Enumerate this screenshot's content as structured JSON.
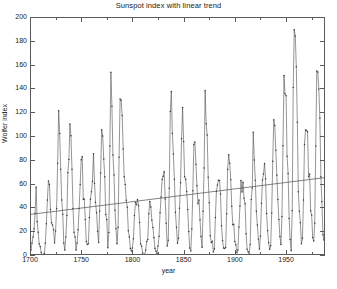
{
  "chart_data": {
    "type": "line",
    "title": "Sunspot index with linear trend",
    "xlabel": "year",
    "ylabel": "Wolfer index",
    "xlim": [
      1700,
      1988
    ],
    "ylim": [
      0,
      200
    ],
    "grid": false,
    "legend": null,
    "markers": "dot",
    "line_color": "#4d4d4d",
    "trend_color": "#4d4d4d",
    "xticks": [
      1700,
      1750,
      1800,
      1850,
      1900,
      1950
    ],
    "xtick_labels": [
      "1700",
      "1750",
      "1800",
      "1850",
      "1900",
      "1950"
    ],
    "xticks_minor": [
      1725,
      1775,
      1825,
      1875,
      1925,
      1975
    ],
    "yticks": [
      0,
      20,
      40,
      60,
      80,
      100,
      120,
      140,
      160,
      180,
      200
    ],
    "ytick_labels": [
      "0",
      "20",
      "40",
      "60",
      "80",
      "100",
      "120",
      "140",
      "160",
      "180",
      "200"
    ],
    "series": [
      {
        "name": "Wolfer sunspot index",
        "x_start": 1700,
        "x_step": 1,
        "values": [
          5,
          11,
          16,
          23,
          36,
          58,
          29,
          20,
          10,
          8,
          3,
          0,
          0,
          2,
          11,
          27,
          47,
          63,
          60,
          39,
          28,
          26,
          22,
          11,
          21,
          40,
          78,
          122,
          103,
          73,
          47,
          35,
          11,
          5,
          16,
          34,
          70,
          81,
          111,
          101,
          73,
          40,
          20,
          16,
          5,
          11,
          22,
          40,
          60,
          80.9,
          83.4,
          47.7,
          47.8,
          30.7,
          12.2,
          9.6,
          10.2,
          32.4,
          47.6,
          54,
          62.9,
          85.9,
          61.2,
          45.1,
          36.4,
          20.9,
          11.4,
          37.8,
          69.8,
          106.1,
          100.8,
          81.6,
          66.5,
          34.8,
          30.6,
          7,
          19.8,
          92.5,
          154.4,
          125.9,
          84.8,
          68.1,
          38.5,
          22.8,
          10.2,
          24.1,
          82.9,
          132,
          130.9,
          118.1,
          89.9,
          66.6,
          60,
          46.9,
          41,
          21.3,
          16,
          6.4,
          4.1,
          6.8,
          14.5,
          34,
          45,
          43.1,
          47.5,
          42.2,
          28.1,
          10.1,
          8.1,
          2.5,
          0,
          1.4,
          5,
          12.2,
          13.9,
          35.4,
          45.8,
          41.1,
          30.1,
          23.9,
          15.6,
          6.6,
          4,
          1.8,
          8.5,
          16.6,
          36.3,
          49.6,
          64.2,
          67,
          70.9,
          47.8,
          27.5,
          8.5,
          13.2,
          56.9,
          121.5,
          138.3,
          103.2,
          85.7,
          64.6,
          36.7,
          24.2,
          10.7,
          15,
          40.1,
          61.5,
          98.5,
          124.7,
          96.3,
          66.6,
          64.5,
          54.1,
          39,
          20.6,
          6.7,
          4.3,
          22.7,
          54.8,
          93.8,
          95.8,
          77.2,
          59.1,
          44,
          47,
          30.5,
          16.3,
          7.3,
          37.6,
          74,
          139,
          111.2,
          101.6,
          66.2,
          44.7,
          17,
          11.3,
          12.4,
          3.4,
          6,
          32.3,
          54.3,
          59.7,
          63.7,
          63.5,
          52.2,
          25.4,
          13.1,
          6.8,
          6.3,
          7.1,
          35.6,
          73,
          85.1,
          78,
          64,
          41.8,
          26.2,
          26.7,
          12.1,
          9.5,
          2.7,
          5,
          24.4,
          42,
          63.5,
          53.8,
          62,
          48.5,
          43.9,
          18.6,
          5.7,
          3.6,
          1.4,
          9.6,
          47.4,
          57.1,
          103.9,
          80.6,
          63.6,
          37.6,
          26.1,
          14.2,
          5.8,
          16.7,
          44.3,
          63.9,
          69,
          77.8,
          64.9,
          35.7,
          21.2,
          11.1,
          5.7,
          8.7,
          36.1,
          79.7,
          114.4,
          109.6,
          88.8,
          67.8,
          47.5,
          30.6,
          16.3,
          9.6,
          33.2,
          92.6,
          151.6,
          136.3,
          134.7,
          83.9,
          69.4,
          31.5,
          13.9,
          4.4,
          38,
          141.7,
          190.2,
          184.8,
          159,
          112.3,
          53.9,
          37.6,
          27.9,
          10.2,
          15.1,
          47,
          93.8,
          105.9,
          105.5,
          104.5,
          66.6,
          68.9,
          38,
          34.5,
          15.5,
          12.6,
          27.5,
          92.5,
          155.4,
          154.6,
          140.4,
          115.9,
          66.6,
          45.9,
          17.9,
          13.4,
          29.3
        ]
      }
    ],
    "trend": {
      "name": "linear trend",
      "x": [
        1700,
        1988
      ],
      "y": [
        35.0,
        66.0
      ]
    },
    "peaks_annotated": [
      {
        "year": 1778,
        "value": 154.4
      },
      {
        "year": 1787,
        "value": 132.0
      },
      {
        "year": 1870,
        "value": 139.0
      },
      {
        "year": 1947,
        "value": 151.6
      },
      {
        "year": 1957,
        "value": 190.2
      },
      {
        "year": 1979,
        "value": 155.4
      }
    ]
  },
  "axis": {
    "ylabel": "Wolfer index",
    "xlabel": "year"
  },
  "caption": ""
}
